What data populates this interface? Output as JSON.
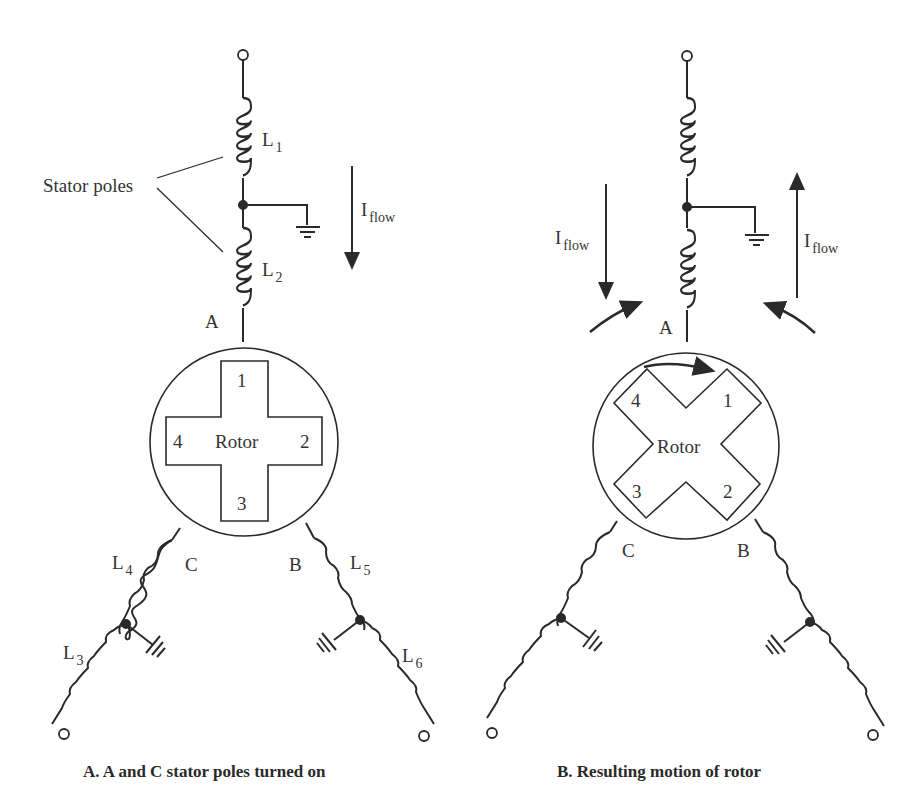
{
  "panel_a": {
    "caption": "A.  A and C stator poles turned on",
    "stator_poles_label": "Stator poles",
    "l1": {
      "main": "L",
      "sub": "1"
    },
    "l2": {
      "main": "L",
      "sub": "2"
    },
    "l3": {
      "main": "L",
      "sub": "3"
    },
    "l4": {
      "main": "L",
      "sub": "4"
    },
    "l5": {
      "main": "L",
      "sub": "5"
    },
    "l6": {
      "main": "L",
      "sub": "6"
    },
    "iflow": {
      "main": "I",
      "sub": "flow",
      "direction": "down"
    },
    "pole_a": "A",
    "pole_b": "B",
    "pole_c": "C",
    "rotor_label": "Rotor",
    "rotor_teeth": [
      "1",
      "2",
      "3",
      "4"
    ]
  },
  "panel_b": {
    "caption": "B.  Resulting motion of rotor",
    "iflow_left": {
      "main": "I",
      "sub": "flow",
      "direction": "down"
    },
    "iflow_right": {
      "main": "I",
      "sub": "flow",
      "direction": "up"
    },
    "pole_a": "A",
    "pole_b": "B",
    "pole_c": "C",
    "rotor_label": "Rotor",
    "rotor_teeth": [
      "1",
      "2",
      "3",
      "4"
    ]
  }
}
